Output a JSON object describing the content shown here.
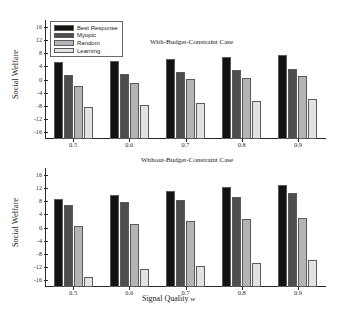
{
  "figure": {
    "xlabel_main": "Signal Quality",
    "xlabel_symbol": "w",
    "ylabel": "Social Welfare"
  },
  "series_colors": {
    "best_response": "#121212",
    "myopic": "#4d4d4d",
    "random": "#b4b4b4",
    "learning": "#e3e3e3"
  },
  "chart_data": [
    {
      "type": "bar",
      "title": "With-Budget-Constraint Case",
      "xlabel": "Signal Quality w",
      "ylabel": "Social Welfare",
      "categories": [
        "0.5",
        "0.6",
        "0.7",
        "0.8",
        "0.9"
      ],
      "ylim": [
        -18,
        18
      ],
      "yticks": [
        16,
        12,
        8,
        4,
        0,
        -4,
        -8,
        -12,
        -16
      ],
      "grid": false,
      "legend_position": "upper-left",
      "series": [
        {
          "name": "Best Response",
          "values": [
            5.2,
            5.5,
            6.3,
            6.9,
            7.4
          ]
        },
        {
          "name": "Myopic",
          "values": [
            1.4,
            1.6,
            2.2,
            2.8,
            3.2
          ]
        },
        {
          "name": "Random",
          "values": [
            -2.0,
            -1.2,
            0.1,
            0.5,
            1.2
          ]
        },
        {
          "name": "Learning",
          "values": [
            -8.2,
            -7.8,
            -7.0,
            -6.4,
            -6.0
          ]
        }
      ]
    },
    {
      "type": "bar",
      "title": "Without-Budget-Constraint Case",
      "xlabel": "Signal Quality w",
      "ylabel": "Social Welfare",
      "categories": [
        "0.5",
        "0.6",
        "0.7",
        "0.8",
        "0.9"
      ],
      "ylim": [
        -18,
        18
      ],
      "yticks": [
        16,
        12,
        8,
        4,
        0,
        -4,
        -8,
        -12,
        -16
      ],
      "grid": false,
      "legend_position": "none",
      "series": [
        {
          "name": "Best Response",
          "values": [
            8.6,
            9.7,
            11.1,
            12.2,
            13.0
          ]
        },
        {
          "name": "Myopic",
          "values": [
            6.8,
            7.6,
            8.4,
            9.3,
            10.4
          ]
        },
        {
          "name": "Random",
          "values": [
            0.4,
            1.1,
            2.0,
            2.6,
            2.9
          ]
        },
        {
          "name": "Learning",
          "values": [
            -15.0,
            -12.6,
            -11.6,
            -10.8,
            -9.7
          ]
        }
      ]
    }
  ],
  "legend": {
    "items": [
      {
        "label": "Best Response",
        "color": "#121212"
      },
      {
        "label": "Myopic",
        "color": "#4d4d4d"
      },
      {
        "label": "Random",
        "color": "#b4b4b4"
      },
      {
        "label": "Learning",
        "color": "#e3e3e3"
      }
    ]
  }
}
